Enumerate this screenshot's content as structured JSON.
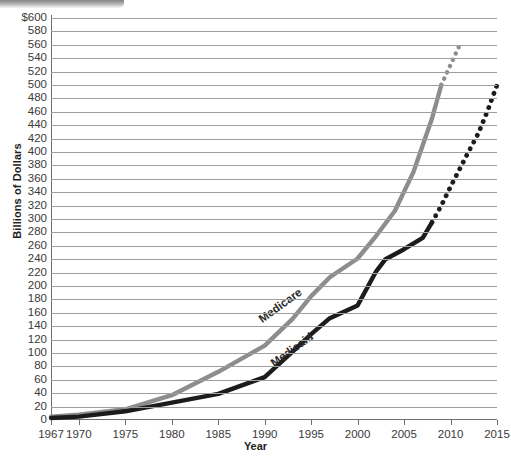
{
  "chart_data": {
    "type": "line",
    "title": "",
    "xlabel": "Year",
    "ylabel": "Billions of Dollars",
    "xlim": [
      1967,
      2015
    ],
    "ylim": [
      0,
      600
    ],
    "ytick_step": 20,
    "grid": true,
    "legend": "inline-series-labels",
    "y_ticks": [
      "$600",
      "580",
      "560",
      "540",
      "520",
      "500",
      "480",
      "460",
      "440",
      "420",
      "400",
      "380",
      "360",
      "340",
      "320",
      "300",
      "280",
      "260",
      "240",
      "220",
      "200",
      "180",
      "160",
      "140",
      "120",
      "100",
      "80",
      "60",
      "40",
      "20",
      "0"
    ],
    "y_tick_values": [
      600,
      580,
      560,
      540,
      520,
      500,
      480,
      460,
      440,
      420,
      400,
      380,
      360,
      340,
      320,
      300,
      280,
      260,
      240,
      220,
      200,
      180,
      160,
      140,
      120,
      100,
      80,
      60,
      40,
      20,
      0
    ],
    "x_ticks": [
      "1967",
      "1970",
      "1975",
      "1980",
      "1985",
      "1990",
      "1995",
      "2000",
      "2005",
      "2010",
      "2015"
    ],
    "x_tick_values": [
      1967,
      1970,
      1975,
      1980,
      1985,
      1990,
      1995,
      2000,
      2005,
      2010,
      2015
    ],
    "series": [
      {
        "name": "Medicare",
        "color": "#8d8d8d",
        "solid": {
          "x": [
            1967,
            1970,
            1975,
            1980,
            1985,
            1990,
            1993,
            1995,
            1997,
            2000,
            2002,
            2004,
            2006,
            2008,
            2009
          ],
          "y": [
            5,
            8,
            16,
            37,
            72,
            111,
            151,
            185,
            213,
            241,
            275,
            312,
            370,
            450,
            500
          ]
        },
        "projected": {
          "x": [
            2009,
            2010,
            2011
          ],
          "y": [
            500,
            530,
            560
          ]
        }
      },
      {
        "name": "Medicaid",
        "color": "#1c1c1c",
        "solid": {
          "x": [
            1967,
            1970,
            1975,
            1980,
            1985,
            1990,
            1993,
            1995,
            1997,
            2000,
            2002,
            2003,
            2005,
            2007,
            2008
          ],
          "y": [
            3,
            5,
            13,
            26,
            39,
            64,
            102,
            128,
            152,
            171,
            222,
            240,
            255,
            272,
            295
          ]
        },
        "projected": {
          "x": [
            2008,
            2009,
            2010,
            2011,
            2012,
            2013,
            2014,
            2015
          ],
          "y": [
            295,
            320,
            348,
            375,
            402,
            428,
            462,
            500
          ]
        }
      }
    ]
  },
  "series_labels": {
    "medicare": "Medicare",
    "medicaid": "Medicaid"
  },
  "axis": {
    "y_title": "Billions of Dollars",
    "x_title": "Year"
  }
}
